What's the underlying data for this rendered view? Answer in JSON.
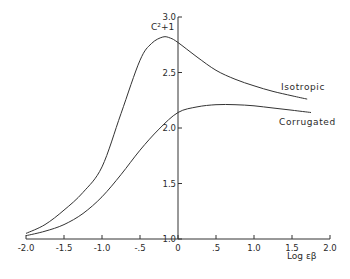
{
  "chart_data": {
    "type": "line",
    "title": "",
    "xlabel": "Log εβ",
    "ylabel": "C²+1",
    "xlim": [
      -2.0,
      2.0
    ],
    "ylim": [
      1.0,
      3.0
    ],
    "grid": false,
    "legend": "inline labels",
    "x_ticks": [
      -2.0,
      -1.5,
      -1.0,
      -0.5,
      0,
      0.5,
      1.0,
      1.5,
      2.0
    ],
    "x_tick_labels": [
      "-2.0",
      "-1.5",
      "-1.0",
      "-.5",
      "0",
      ".5",
      "1.0",
      "1.5",
      "2.0"
    ],
    "y_ticks": [
      1.0,
      1.5,
      2.0,
      2.5,
      3.0
    ],
    "y_tick_labels": [
      "1.0",
      "1.5",
      "2.0",
      "2.5",
      "3.0"
    ],
    "series": [
      {
        "name": "Isotropic",
        "x": [
          -2.0,
          -1.75,
          -1.5,
          -1.25,
          -1.0,
          -0.75,
          -0.5,
          -0.35,
          -0.2,
          -0.1,
          0,
          0.25,
          0.5,
          0.75,
          1.0,
          1.25,
          1.5,
          1.7
        ],
        "y": [
          1.05,
          1.13,
          1.26,
          1.42,
          1.65,
          2.13,
          2.61,
          2.76,
          2.82,
          2.81,
          2.77,
          2.64,
          2.52,
          2.44,
          2.38,
          2.33,
          2.29,
          2.26
        ]
      },
      {
        "name": "Corrugated",
        "x": [
          -2.0,
          -1.75,
          -1.5,
          -1.25,
          -1.0,
          -0.75,
          -0.5,
          -0.25,
          0,
          0.25,
          0.5,
          0.75,
          1.0,
          1.25,
          1.5,
          1.75
        ],
        "y": [
          1.03,
          1.07,
          1.13,
          1.23,
          1.38,
          1.58,
          1.8,
          1.99,
          2.14,
          2.19,
          2.21,
          2.21,
          2.2,
          2.18,
          2.16,
          2.14
        ]
      }
    ]
  },
  "labels": {
    "ylabel": "C²+1",
    "xlabel": "Log εβ",
    "isotropic": "Isotropic",
    "corrugated": "Corrugated"
  }
}
